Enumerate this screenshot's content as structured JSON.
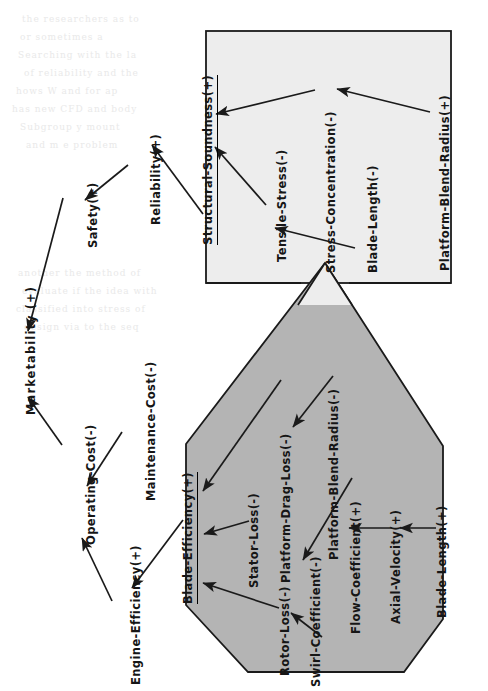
{
  "diagram": {
    "orientation": "rotated-90-ccw",
    "colors": {
      "page_background": "#ffffff",
      "structural_box_fill": "#ededed",
      "efficiency_polygon_fill": "#b4b4b4",
      "stroke": "#1a1a1a",
      "text": "#161616"
    }
  },
  "nodes": {
    "marketability": "Marketability (+)",
    "safety": "Safety(+)",
    "reliability": "Reliability(+)",
    "operating_cost": "Operating-Cost(-)",
    "maintenance_cost": "Maintenance-Cost(-)",
    "engine_efficiency": "Engine-Efficiency(+)",
    "structural_soundness": "Structural-Soundness(+)",
    "tensile_stress": "Tensile-Stress(-)",
    "stress_concentration": "Stress-Concentration(-)",
    "blade_length_top": "Blade-Length(-)",
    "platform_blend_radius_top": "Platform-Blend-Radius(+)",
    "blade_efficiency": "Blade-Efficiency(+)",
    "stator_loss": "Stator-Loss(-)",
    "platform_drag_loss": "Platform-Drag-Loss(-)",
    "platform_blend_radius_bot": "Platform-Blend-Radius(-)",
    "rotor_loss": "Rotor-Loss(-)",
    "swirl_coefficient": "Swirl-Coefficient(-)",
    "flow_coefficient": "Flow-Coefficient(+)",
    "axial_velocity": "Axial-Velocity(+)",
    "blade_length_bot": "Blade-Length(+)"
  },
  "groups": {
    "structural_box_label": "Structural-Soundness(+)",
    "efficiency_polygon_label": "Blade-Efficiency(+)"
  },
  "edges": [
    {
      "from": "safety",
      "to": "marketability"
    },
    {
      "from": "operating_cost",
      "to": "marketability"
    },
    {
      "from": "reliability",
      "to": "safety"
    },
    {
      "from": "structural_soundness",
      "to": "reliability"
    },
    {
      "from": "maintenance_cost",
      "to": "operating_cost"
    },
    {
      "from": "engine_efficiency",
      "to": "operating_cost"
    },
    {
      "from": "blade_efficiency",
      "to": "engine_efficiency"
    },
    {
      "from": "tensile_stress",
      "to": "structural_soundness"
    },
    {
      "from": "stress_concentration",
      "to": "structural_soundness"
    },
    {
      "from": "blade_length_top",
      "to": "tensile_stress"
    },
    {
      "from": "platform_blend_radius_top",
      "to": "stress_concentration"
    },
    {
      "from": "stator_loss",
      "to": "blade_efficiency"
    },
    {
      "from": "platform_drag_loss",
      "to": "blade_efficiency"
    },
    {
      "from": "rotor_loss",
      "to": "blade_efficiency"
    },
    {
      "from": "platform_blend_radius_bot",
      "to": "platform_drag_loss"
    },
    {
      "from": "swirl_coefficient",
      "to": "rotor_loss"
    },
    {
      "from": "flow_coefficient",
      "to": "swirl_coefficient"
    },
    {
      "from": "axial_velocity",
      "to": "flow_coefficient"
    },
    {
      "from": "blade_length_bot",
      "to": "axial_velocity"
    }
  ],
  "bleed_text": {
    "l1": "the   researchers  as   to",
    "l2": "or      sometimes      a",
    "l3": "Searching   with   the   la",
    "l4": "of  reliability  and  the",
    "l5": "hows  W   and  for   ap",
    "l6": "has new CFD and body",
    "l7": "Subgroup  y    mount",
    "l8": "and  m  e       problem",
    "l9": "another  the   method of",
    "l10": "evaluate  if  the  idea  with",
    "l11": "classified into stress of",
    "l12": "design  via  to  the  seq"
  }
}
